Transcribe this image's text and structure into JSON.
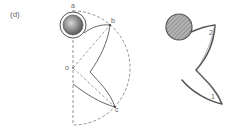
{
  "figure": {
    "panel_label": "(d)",
    "colors": {
      "line": "#555555",
      "dashed": "#777777",
      "label": "#666666",
      "hatch_fill": "#9a9a9a",
      "ball_fill": "#8a8a8a"
    },
    "left_diagram": {
      "description": "geometric construction",
      "points": {
        "a": "a",
        "b": "b",
        "o": "o",
        "c": "c"
      }
    },
    "right_diagram": {
      "description": "resulting shape",
      "labels": {
        "one": "1",
        "two": "2"
      }
    }
  }
}
